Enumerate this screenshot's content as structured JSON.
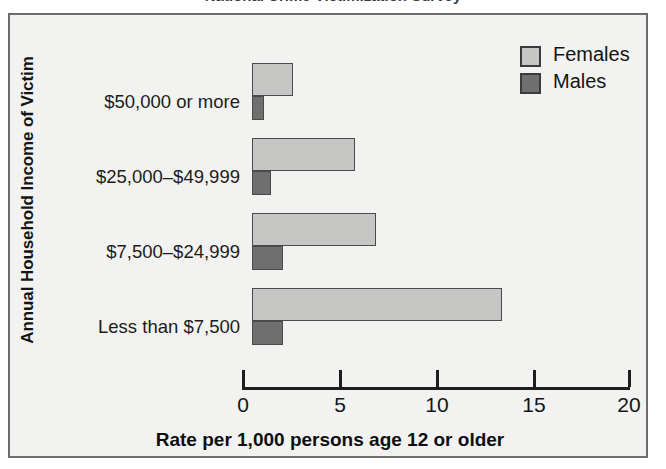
{
  "figure": {
    "partial_top_title": "National Crime Victimization Survey",
    "background_color": "#f2f2f0",
    "frame_color": "#6d6d6d"
  },
  "legend": {
    "position": "top-right",
    "entries": [
      {
        "label": "Females",
        "color": "#c6c6c4",
        "swatch": "legend-swatch-females"
      },
      {
        "label": "Males",
        "color": "#6f6f6f",
        "swatch": "legend-swatch-males"
      }
    ]
  },
  "axes": {
    "ylabel": "Annual Household Income of Victim",
    "xlabel": "Rate per 1,000 persons age 12 or older",
    "xticks": [
      "0",
      "5",
      "10",
      "15",
      "20"
    ]
  },
  "chart_data": {
    "type": "bar",
    "orientation": "horizontal",
    "title": "",
    "xlabel": "Rate per 1,000 persons age 12 or older",
    "ylabel": "Annual Household Income of Victim",
    "categories": [
      "$50,000 or more",
      "$25,000–$49,999",
      "$7,500–$24,999",
      "Less than $7,500"
    ],
    "series": [
      {
        "name": "Females",
        "color": "#c6c6c4",
        "values": [
          2.1,
          5.3,
          6.4,
          12.9
        ]
      },
      {
        "name": "Males",
        "color": "#6f6f6f",
        "values": [
          0.6,
          1.0,
          1.6,
          1.6
        ]
      }
    ],
    "xlim": [
      0,
      20
    ],
    "xticks": [
      0,
      5,
      10,
      15,
      20
    ],
    "grid": false,
    "legend_position": "top-right"
  }
}
